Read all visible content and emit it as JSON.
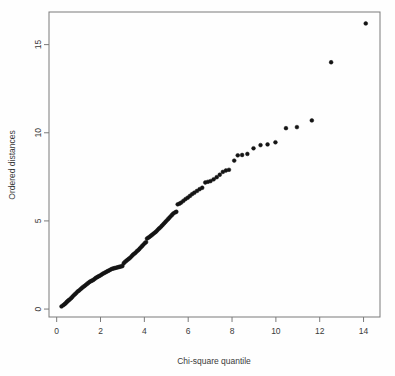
{
  "chart_data": {
    "type": "scatter",
    "title": "",
    "subtitle": "",
    "xlabel": "Chi-square quantile",
    "ylabel": "Ordered distances",
    "xlim": [
      -0.35,
      14.75
    ],
    "ylim": [
      -0.45,
      16.85
    ],
    "xticks": [
      0,
      2,
      4,
      6,
      8,
      10,
      12,
      14
    ],
    "xtick_labels": [
      "0",
      "2",
      "4",
      "6",
      "8",
      "10",
      "12",
      "14"
    ],
    "yticks": [
      0,
      5,
      10,
      15
    ],
    "ytick_labels": [
      "0",
      "5",
      "10",
      "15"
    ],
    "grid": false,
    "legend": null,
    "legend_position": "none",
    "point_color": "#141414",
    "point_marker": "open-circle",
    "point_radius": 1.9,
    "frame_color": "#7a7a7a",
    "background_color": "#fefefe",
    "n_points": 118,
    "points": [
      [
        0.22,
        0.15
      ],
      [
        0.3,
        0.22
      ],
      [
        0.36,
        0.28
      ],
      [
        0.41,
        0.33
      ],
      [
        0.46,
        0.4
      ],
      [
        0.5,
        0.45
      ],
      [
        0.55,
        0.5
      ],
      [
        0.6,
        0.55
      ],
      [
        0.66,
        0.62
      ],
      [
        0.72,
        0.7
      ],
      [
        0.78,
        0.78
      ],
      [
        0.84,
        0.85
      ],
      [
        0.9,
        0.92
      ],
      [
        0.96,
        1.0
      ],
      [
        1.02,
        1.05
      ],
      [
        1.08,
        1.12
      ],
      [
        1.14,
        1.18
      ],
      [
        1.2,
        1.25
      ],
      [
        1.26,
        1.3
      ],
      [
        1.32,
        1.36
      ],
      [
        1.38,
        1.42
      ],
      [
        1.44,
        1.48
      ],
      [
        1.5,
        1.54
      ],
      [
        1.56,
        1.58
      ],
      [
        1.62,
        1.62
      ],
      [
        1.68,
        1.66
      ],
      [
        1.74,
        1.72
      ],
      [
        1.8,
        1.78
      ],
      [
        1.86,
        1.82
      ],
      [
        1.92,
        1.86
      ],
      [
        1.98,
        1.9
      ],
      [
        2.04,
        1.95
      ],
      [
        2.1,
        2.0
      ],
      [
        2.16,
        2.04
      ],
      [
        2.22,
        2.08
      ],
      [
        2.28,
        2.12
      ],
      [
        2.34,
        2.16
      ],
      [
        2.4,
        2.2
      ],
      [
        2.46,
        2.24
      ],
      [
        2.52,
        2.28
      ],
      [
        2.58,
        2.3
      ],
      [
        2.64,
        2.32
      ],
      [
        2.7,
        2.34
      ],
      [
        2.76,
        2.36
      ],
      [
        2.82,
        2.38
      ],
      [
        2.88,
        2.4
      ],
      [
        2.94,
        2.42
      ],
      [
        3.0,
        2.44
      ],
      [
        3.06,
        2.6
      ],
      [
        3.12,
        2.68
      ],
      [
        3.18,
        2.74
      ],
      [
        3.24,
        2.8
      ],
      [
        3.3,
        2.86
      ],
      [
        3.36,
        2.92
      ],
      [
        3.42,
        3.0
      ],
      [
        3.48,
        3.08
      ],
      [
        3.54,
        3.14
      ],
      [
        3.6,
        3.2
      ],
      [
        3.66,
        3.28
      ],
      [
        3.72,
        3.34
      ],
      [
        3.78,
        3.42
      ],
      [
        3.84,
        3.5
      ],
      [
        3.9,
        3.58
      ],
      [
        3.96,
        3.66
      ],
      [
        4.02,
        3.74
      ],
      [
        4.08,
        3.8
      ],
      [
        4.12,
        4.0
      ],
      [
        4.18,
        4.05
      ],
      [
        4.24,
        4.1
      ],
      [
        4.3,
        4.16
      ],
      [
        4.36,
        4.22
      ],
      [
        4.42,
        4.28
      ],
      [
        4.48,
        4.34
      ],
      [
        4.54,
        4.4
      ],
      [
        4.6,
        4.48
      ],
      [
        4.66,
        4.56
      ],
      [
        4.72,
        4.62
      ],
      [
        4.78,
        4.7
      ],
      [
        4.84,
        4.78
      ],
      [
        4.9,
        4.86
      ],
      [
        4.96,
        4.94
      ],
      [
        5.02,
        5.02
      ],
      [
        5.08,
        5.1
      ],
      [
        5.14,
        5.18
      ],
      [
        5.2,
        5.26
      ],
      [
        5.26,
        5.34
      ],
      [
        5.32,
        5.42
      ],
      [
        5.4,
        5.48
      ],
      [
        5.46,
        5.52
      ],
      [
        5.52,
        5.94
      ],
      [
        5.6,
        5.98
      ],
      [
        5.68,
        6.04
      ],
      [
        5.78,
        6.14
      ],
      [
        5.88,
        6.24
      ],
      [
        5.98,
        6.32
      ],
      [
        6.08,
        6.42
      ],
      [
        6.18,
        6.52
      ],
      [
        6.28,
        6.6
      ],
      [
        6.4,
        6.7
      ],
      [
        6.52,
        6.8
      ],
      [
        6.64,
        6.88
      ],
      [
        6.78,
        7.18
      ],
      [
        6.9,
        7.22
      ],
      [
        7.02,
        7.26
      ],
      [
        7.16,
        7.36
      ],
      [
        7.3,
        7.48
      ],
      [
        7.44,
        7.62
      ],
      [
        7.58,
        7.78
      ],
      [
        7.72,
        7.86
      ],
      [
        7.86,
        7.9
      ],
      [
        8.1,
        8.42
      ],
      [
        8.26,
        8.72
      ],
      [
        8.46,
        8.74
      ],
      [
        8.7,
        8.8
      ],
      [
        8.98,
        9.12
      ],
      [
        9.3,
        9.3
      ],
      [
        9.62,
        9.34
      ],
      [
        9.98,
        9.46
      ],
      [
        10.46,
        10.26
      ],
      [
        10.96,
        10.32
      ],
      [
        11.64,
        10.7
      ],
      [
        12.52,
        14.0
      ],
      [
        14.1,
        16.2
      ]
    ]
  }
}
